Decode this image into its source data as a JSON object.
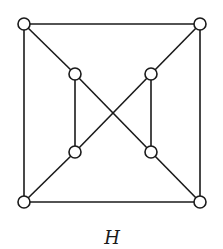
{
  "diagram": {
    "type": "graph",
    "label": "H",
    "colors": {
      "stroke": "#1a1a1a",
      "node_fill": "#ffffff",
      "background": "#ffffff"
    },
    "node_radius": 6,
    "nodes": [
      {
        "id": "outer-top-left",
        "x": 24,
        "y": 24
      },
      {
        "id": "outer-top-right",
        "x": 200,
        "y": 24
      },
      {
        "id": "outer-bottom-left",
        "x": 24,
        "y": 202
      },
      {
        "id": "outer-bottom-right",
        "x": 200,
        "y": 202
      },
      {
        "id": "inner-top-left",
        "x": 75,
        "y": 74
      },
      {
        "id": "inner-top-right",
        "x": 151,
        "y": 74
      },
      {
        "id": "inner-bottom-left",
        "x": 75,
        "y": 152
      },
      {
        "id": "inner-bottom-right",
        "x": 151,
        "y": 152
      }
    ],
    "edges": [
      [
        "outer-top-left",
        "outer-top-right"
      ],
      [
        "outer-top-left",
        "outer-bottom-left"
      ],
      [
        "outer-top-right",
        "outer-bottom-right"
      ],
      [
        "outer-bottom-left",
        "outer-bottom-right"
      ],
      [
        "outer-top-left",
        "inner-top-left"
      ],
      [
        "outer-top-right",
        "inner-top-right"
      ],
      [
        "outer-bottom-left",
        "inner-bottom-left"
      ],
      [
        "outer-bottom-right",
        "inner-bottom-right"
      ],
      [
        "inner-top-left",
        "inner-bottom-left"
      ],
      [
        "inner-top-right",
        "inner-bottom-right"
      ],
      [
        "inner-top-left",
        "inner-bottom-right"
      ],
      [
        "inner-top-right",
        "inner-bottom-left"
      ]
    ],
    "label_position": {
      "x": 112,
      "y": 244
    }
  }
}
